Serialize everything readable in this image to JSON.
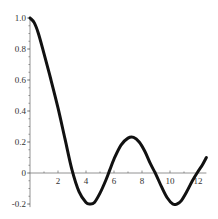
{
  "chart_data": {
    "type": "line",
    "title": "",
    "xlabel": "",
    "ylabel": "",
    "xlim": [
      0,
      12.6
    ],
    "ylim": [
      -0.22,
      1.0
    ],
    "grid": false,
    "legend": null,
    "x_ticks": [
      2,
      4,
      6,
      8,
      10,
      12
    ],
    "x_tick_labels": [
      "2",
      "4",
      "6",
      "8",
      "10",
      "12"
    ],
    "y_ticks": [
      -0.2,
      0,
      0.2,
      0.4,
      0.6,
      0.8,
      1.0
    ],
    "y_tick_labels": [
      "-0.2",
      "0",
      "0.2",
      "0.4",
      "0.6",
      "0.8",
      "1.0"
    ],
    "line_color": "#111111",
    "series": [
      {
        "name": "curve",
        "x": [
          0,
          0.3,
          0.6,
          1.0,
          1.5,
          2.0,
          2.5,
          3.0,
          3.5,
          4.0,
          4.3,
          4.6,
          5.0,
          5.4,
          5.7,
          6.0,
          6.5,
          7.0,
          7.4,
          7.8,
          8.2,
          8.6,
          9.0,
          9.4,
          9.8,
          10.2,
          10.5,
          10.8,
          11.2,
          11.6,
          12.0,
          12.3,
          12.6
        ],
        "y": [
          1.0,
          0.97,
          0.9,
          0.77,
          0.6,
          0.42,
          0.22,
          0.02,
          -0.12,
          -0.19,
          -0.2,
          -0.19,
          -0.13,
          -0.05,
          0.02,
          0.09,
          0.18,
          0.225,
          0.23,
          0.2,
          0.14,
          0.06,
          -0.01,
          -0.09,
          -0.16,
          -0.2,
          -0.2,
          -0.18,
          -0.12,
          -0.05,
          0.01,
          0.05,
          0.1
        ]
      }
    ]
  }
}
